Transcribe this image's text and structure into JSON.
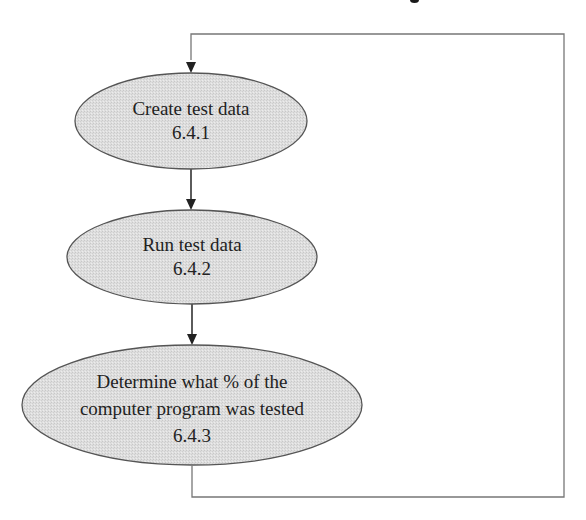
{
  "diagram": {
    "type": "flowchart-loop",
    "colors": {
      "node_fill": "#dcdcdc",
      "node_stroke": "#555555",
      "edge_stroke": "#333333",
      "loop_stroke": "#777777",
      "text": "#222222"
    },
    "nodes": [
      {
        "id": "6.4.1",
        "lines": [
          "Create test data",
          "6.4.1"
        ],
        "cx": 191,
        "cy": 121,
        "rx": 116,
        "ry": 48
      },
      {
        "id": "6.4.2",
        "lines": [
          "Run test data",
          "6.4.2"
        ],
        "cx": 192,
        "cy": 257,
        "rx": 125,
        "ry": 47
      },
      {
        "id": "6.4.3",
        "lines": [
          "Determine what % of the",
          "computer program was tested",
          "6.4.3"
        ],
        "cx": 192,
        "cy": 405,
        "rx": 170,
        "ry": 60
      }
    ],
    "edges": [
      {
        "from": "loop-entry",
        "to": "6.4.1"
      },
      {
        "from": "6.4.1",
        "to": "6.4.2"
      },
      {
        "from": "6.4.2",
        "to": "6.4.3"
      },
      {
        "from": "6.4.3",
        "to": "loop-entry",
        "route": "down-right-up-left"
      }
    ]
  }
}
